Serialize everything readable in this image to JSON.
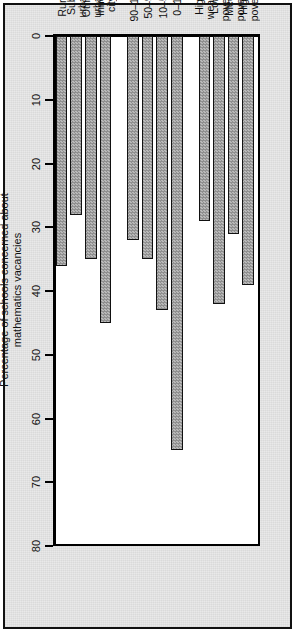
{
  "figure": {
    "background_color": "#e9e9e9",
    "plot_background_color": "#ffffff",
    "bar_fill_color": "#9a9a9a",
    "bar_edge_color": "#111111",
    "axis_color": "#000000"
  },
  "chart_data": {
    "type": "bar",
    "orientation": "horizontal",
    "title": "",
    "subtitle": "",
    "xlabel": "Percentage of schools concerned about\nmathematics vacancies",
    "ylabel": "",
    "value_axis_title_line1": "Percentage of schools concerned about",
    "value_axis_title_line2": "mathematics vacancies",
    "xlim": [
      0,
      80
    ],
    "grid": false,
    "legend": false,
    "legend_position": "none",
    "tick_labels": [
      "0",
      "10",
      "20",
      "30",
      "40",
      "50",
      "60",
      "70",
      "80"
    ],
    "tick_values": [
      0,
      10,
      20,
      30,
      40,
      50,
      60,
      70,
      80
    ],
    "categories": [
      "High poverty",
      "Med. poverty",
      "Low poverty",
      "High wealth",
      "0-10",
      "10-50",
      "50-90",
      "90-100",
      "Inner city",
      "Other urban",
      "Sub-urban",
      "Rural"
    ],
    "values": [
      39,
      31,
      42,
      29,
      65,
      43,
      35,
      32,
      45,
      35,
      28,
      36
    ],
    "groups": [
      {
        "name": "SES",
        "categories": [
          "High poverty",
          "Med. poverty",
          "Low poverty",
          "High wealth"
        ],
        "values": [
          39,
          31,
          42,
          29
        ]
      },
      {
        "name": "Percentage of white students",
        "categories": [
          "0-10",
          "10-50",
          "50-90",
          "90-100"
        ],
        "values": [
          65,
          43,
          35,
          32
        ]
      },
      {
        "name": "Location",
        "categories": [
          "Inner city",
          "Other urban",
          "Sub-urban",
          "Rural"
        ],
        "values": [
          45,
          35,
          28,
          36
        ]
      }
    ],
    "bars": [
      {
        "label": "High poverty",
        "label_line1": "High",
        "label_line2": "poverty",
        "value": 39,
        "group": "SES"
      },
      {
        "label": "Med. poverty",
        "label_line1": "Med.",
        "label_line2": "poverty",
        "value": 31,
        "group": "SES"
      },
      {
        "label": "Low poverty",
        "label_line1": "Low",
        "label_line2": "poverty",
        "value": 42,
        "group": "SES"
      },
      {
        "label": "High wealth",
        "label_line1": "High",
        "label_line2": "wealth",
        "value": 29,
        "group": "SES"
      },
      {
        "label": "0-10",
        "label_line1": "0–10",
        "label_line2": "",
        "value": 65,
        "group": "Percentage of white students"
      },
      {
        "label": "10-50",
        "label_line1": "10–50",
        "label_line2": "",
        "value": 43,
        "group": "Percentage of white students"
      },
      {
        "label": "50-90",
        "label_line1": "50–90",
        "label_line2": "",
        "value": 35,
        "group": "Percentage of white students"
      },
      {
        "label": "90-100",
        "label_line1": "90–100",
        "label_line2": "",
        "value": 32,
        "group": "Percentage of white students"
      },
      {
        "label": "Inner city",
        "label_line1": "Inner",
        "label_line2": "city",
        "value": 45,
        "group": "Location"
      },
      {
        "label": "Other urban",
        "label_line1": "Other",
        "label_line2": "urban",
        "value": 35,
        "group": "Location"
      },
      {
        "label": "Sub-urban",
        "label_line1": "Sub-",
        "label_line2": "urban",
        "value": 28,
        "group": "Location"
      },
      {
        "label": "Rural",
        "label_line1": "Rural",
        "label_line2": "",
        "value": 36,
        "group": "Location"
      }
    ],
    "group_labels": [
      "SES",
      "Percentage of white students",
      "Location"
    ]
  }
}
